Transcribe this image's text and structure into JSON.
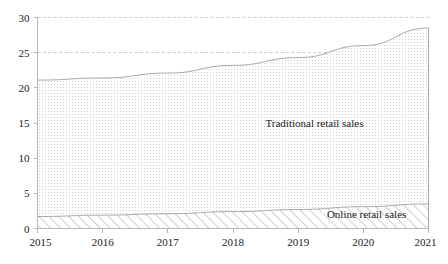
{
  "chart_data": {
    "type": "area",
    "stacked": true,
    "title": "",
    "subtitle": "",
    "xlabel": "",
    "ylabel": "",
    "categories": [
      "2015",
      "2016",
      "2017",
      "2018",
      "2019",
      "2020",
      "2021"
    ],
    "x": [
      2015,
      2016,
      2017,
      2018,
      2019,
      2020,
      2021
    ],
    "xlim": [
      2015,
      2021
    ],
    "ylim": [
      0,
      30
    ],
    "y_ticks": [
      0,
      5,
      10,
      15,
      20,
      25,
      30
    ],
    "y_tick_labels": [
      "0",
      "5",
      "10",
      "15",
      "20",
      "25",
      "30"
    ],
    "x_ticks": [
      2015,
      2016,
      2017,
      2018,
      2019,
      2020,
      2021
    ],
    "x_tick_labels": [
      "2015",
      "2016",
      "2017",
      "2018",
      "2019",
      "2020",
      "2021"
    ],
    "gridlines": {
      "horizontal_dashed_at": [
        25,
        30
      ],
      "vertical": false
    },
    "legend_position": "inline-annotation",
    "series": [
      {
        "name": "Online retail sales",
        "fill": "diagonal-hatch",
        "color": "#9a9a9a",
        "values": [
          1.7,
          1.9,
          2.1,
          2.4,
          2.7,
          3.1,
          3.5
        ],
        "label": "Online retail sales",
        "label_x": 2020.05,
        "label_y": 1.55
      },
      {
        "name": "Traditional retail sales",
        "fill": "fine-dotted",
        "color": "#9a9a9a",
        "values": [
          19.4,
          19.5,
          20.0,
          20.8,
          21.6,
          22.9,
          25.0
        ],
        "label": "Traditional retail sales",
        "label_x": 2019.25,
        "label_y": 14.5
      }
    ],
    "stack_totals": [
      21.1,
      21.4,
      22.1,
      23.2,
      24.3,
      26.0,
      28.5
    ],
    "annotations": [
      {
        "text": "Traditional retail sales",
        "x": 2019.25,
        "y": 14.5
      },
      {
        "text": "Online retail sales",
        "x": 2020.05,
        "y": 1.55
      }
    ]
  },
  "axes": {
    "y_tick_labels": [
      "30",
      "25",
      "20",
      "15",
      "10",
      "5",
      "0"
    ],
    "x_tick_labels": [
      "2015",
      "2016",
      "2017",
      "2018",
      "2019",
      "2020",
      "2021"
    ]
  },
  "labels": {
    "traditional": "Traditional retail sales",
    "online": "Online retail sales"
  },
  "colors": {
    "axis": "#b8b8b8",
    "grid": "#c9c9c9",
    "series_outline": "#9a9a9a",
    "text": "#1a1a1a",
    "background": "#ffffff"
  }
}
